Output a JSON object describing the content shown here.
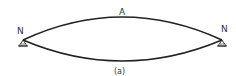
{
  "diagram": {
    "top_arc_label": "A",
    "left_node_label": "N",
    "right_node_label": "N",
    "caption": "(a)",
    "line_color": "#222222",
    "label_color": "#333333"
  }
}
